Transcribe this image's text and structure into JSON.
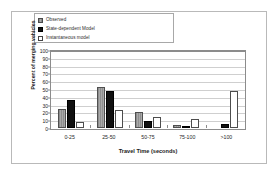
{
  "chart_data": {
    "type": "bar",
    "title": "",
    "xlabel": "Travel Time (seconds)",
    "ylabel": "Percent of merging vehicles",
    "ylim": [
      0,
      100
    ],
    "ytick_step": 10,
    "yticks": [
      100,
      90,
      80,
      70,
      60,
      50,
      40,
      30,
      20,
      10,
      0
    ],
    "categories": [
      "0-25",
      "25-50",
      "50-75",
      "75-100",
      ">100"
    ],
    "grid": true,
    "legend_position": "top-left",
    "series": [
      {
        "name": "Observed",
        "color": "#9c9c9c",
        "swatch": "gray-hatched-swatch",
        "values": [
          24,
          53,
          20,
          4,
          0
        ]
      },
      {
        "name": "State-dependent Model",
        "color": "#101010",
        "swatch": "black-swatch",
        "values": [
          36,
          48,
          9,
          3,
          5
        ]
      },
      {
        "name": "Instantaneous model",
        "color": "#ffffff",
        "swatch": "white-swatch",
        "values": [
          8,
          23,
          14,
          11,
          48
        ]
      }
    ]
  },
  "legend": {
    "items": [
      {
        "label": "Observed"
      },
      {
        "label": "State-dependent Model"
      },
      {
        "label": "Instantaneous model"
      }
    ]
  },
  "colors": {
    "frame_border": "#b9b9b9",
    "plot_border": "#8c8c8c",
    "gridline": "#cfcfcf",
    "background": "#ffffff"
  }
}
